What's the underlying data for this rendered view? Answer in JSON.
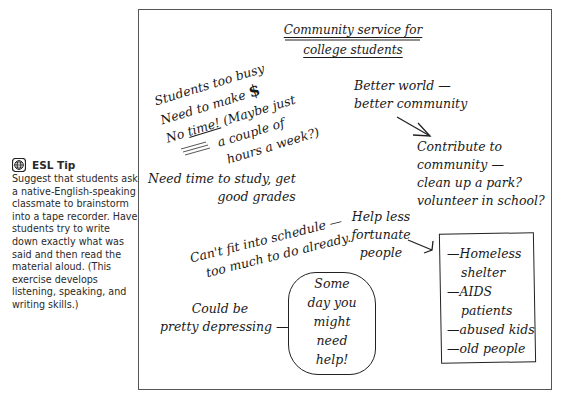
{
  "sidebar": {
    "tip_icon": "globe-icon",
    "tip_title": "ESL Tip",
    "tip_body": "Suggest that students ask a native-English-speaking classmate to brainstorm into a tape recorder. Have students try to write down exactly what was said and then read the material aloud. (This exercise develops listening, speaking, and writing skills.)"
  },
  "cluster": {
    "title_line1": "Community service for",
    "title_line2": "college students",
    "busy": {
      "line1": "Students too busy",
      "line2_text": "Need to make",
      "line2_symbol": "$",
      "line3_no": "No ",
      "line3_time": "time!",
      "line3_rest": " (Maybe just",
      "line4": "a couple of",
      "line5": "hours a week?)"
    },
    "better": {
      "line1": "Better world —",
      "line2": "better community"
    },
    "contribute": {
      "line1": "Contribute to",
      "line2": "community —",
      "line3": "clean up a park?",
      "line4": "volunteer in school?"
    },
    "study": {
      "line1": "Need time to study, get",
      "line2": "good grades"
    },
    "schedule": {
      "line1": "Can't fit into schedule —",
      "line2": "too much to do already."
    },
    "help": {
      "line1": "Help less",
      "line2": "fortunate",
      "line3": "people"
    },
    "list_box": {
      "items": [
        "—Homeless",
        "shelter",
        "—AIDS",
        "patients",
        "—abused kids",
        "—old people"
      ]
    },
    "depressing": {
      "line1": "Could be",
      "line2": "pretty depressing —"
    },
    "someday": {
      "lines": [
        "Some",
        "day you",
        "might",
        "need",
        "help!"
      ]
    }
  }
}
